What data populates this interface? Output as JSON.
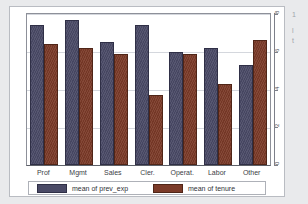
{
  "figure": {
    "background_color": "#ffffff",
    "page_color": "#e9eaec"
  },
  "chart_data": {
    "type": "bar",
    "title": "",
    "subtitle": "",
    "xlabel": "",
    "ylabel": "",
    "categories": [
      "Prof",
      "Mgmt",
      "Sales",
      "Cler.",
      "Operat.",
      "Labor",
      "Other"
    ],
    "series": [
      {
        "name": "mean of prev_exp",
        "color": "#4a4a66",
        "values": [
          7.4,
          7.7,
          6.5,
          7.4,
          6.0,
          6.2,
          5.3
        ]
      },
      {
        "name": "mean of tenure",
        "color": "#7b3a28",
        "values": [
          6.4,
          6.2,
          5.9,
          3.7,
          5.9,
          4.3,
          6.6
        ]
      }
    ],
    "ylim": [
      0,
      8
    ],
    "yticks": [
      0,
      2,
      4,
      6,
      8
    ],
    "ytick_labels": [
      "0",
      "2",
      "4",
      "6",
      "8"
    ],
    "grid": true,
    "grid_axis": "y",
    "legend_position": "bottom"
  },
  "legend": {
    "entries": [
      {
        "label": "mean of prev_exp",
        "color": "#4a4a66"
      },
      {
        "label": "mean of tenure",
        "color": "#7b3a28"
      }
    ]
  },
  "margin_notes": {
    "line1": "1",
    "line2": "l",
    "line3": "t"
  }
}
